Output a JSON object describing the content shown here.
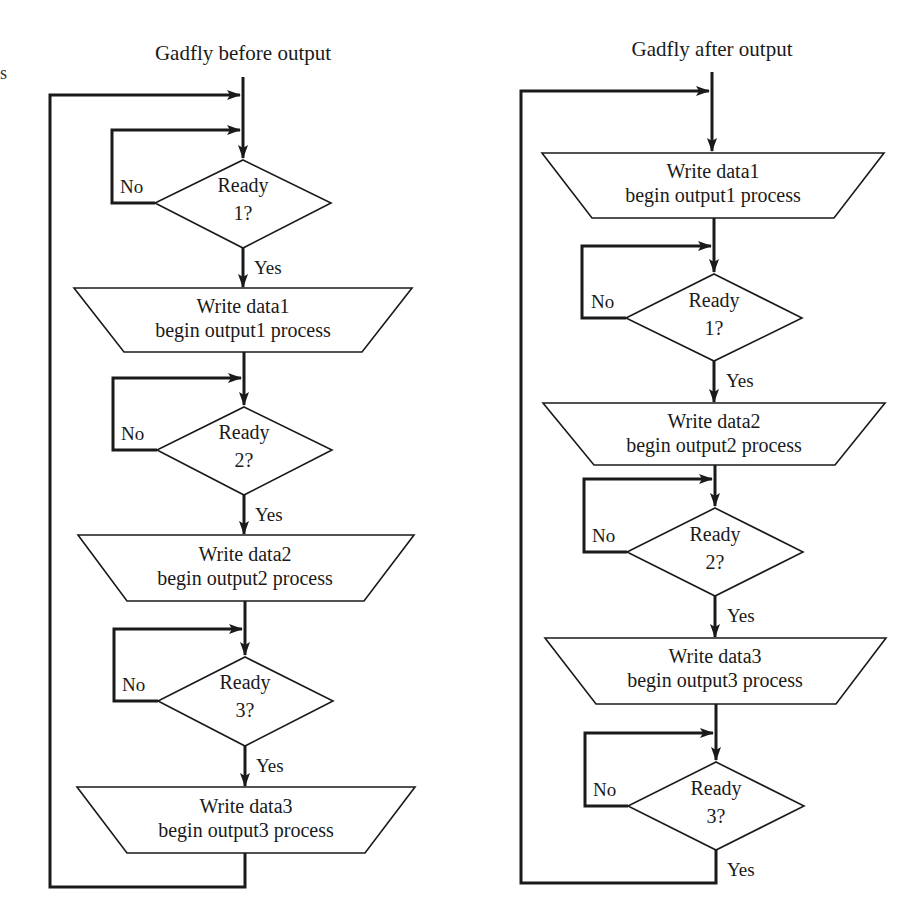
{
  "stray_fragment": "s",
  "flowcharts": [
    {
      "title": "Gadfly before output",
      "steps": [
        {
          "type": "decision",
          "line1": "Ready",
          "line2": "1?",
          "no": "No",
          "yes": "Yes"
        },
        {
          "type": "io",
          "line1": "Write data1",
          "line2": "begin output1 process"
        },
        {
          "type": "decision",
          "line1": "Ready",
          "line2": "2?",
          "no": "No",
          "yes": "Yes"
        },
        {
          "type": "io",
          "line1": "Write data2",
          "line2": "begin output2 process"
        },
        {
          "type": "decision",
          "line1": "Ready",
          "line2": "3?",
          "no": "No",
          "yes": "Yes"
        },
        {
          "type": "io",
          "line1": "Write data3",
          "line2": "begin output3 process"
        }
      ]
    },
    {
      "title": "Gadfly after output",
      "steps": [
        {
          "type": "io",
          "line1": "Write data1",
          "line2": "begin output1 process"
        },
        {
          "type": "decision",
          "line1": "Ready",
          "line2": "1?",
          "no": "No",
          "yes": "Yes"
        },
        {
          "type": "io",
          "line1": "Write data2",
          "line2": "begin output2 process"
        },
        {
          "type": "decision",
          "line1": "Ready",
          "line2": "2?",
          "no": "No",
          "yes": "Yes"
        },
        {
          "type": "io",
          "line1": "Write data3",
          "line2": "begin output3 process"
        },
        {
          "type": "decision",
          "line1": "Ready",
          "line2": "3?",
          "no": "No",
          "yes": "Yes"
        }
      ]
    }
  ],
  "colors": {
    "stroke": "#1a1a1a",
    "background": "#ffffff"
  }
}
